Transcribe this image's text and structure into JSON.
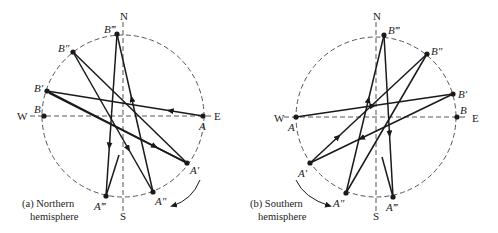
{
  "colors": {
    "ink": "#1a1a1a",
    "dash": "#444444",
    "background": "#ffffff"
  },
  "panels": [
    {
      "id": "northern",
      "caption_line1": "(a)  Northern",
      "caption_line2": "hemisphere",
      "caption_pos": [
        22,
        207
      ],
      "center": [
        123,
        116
      ],
      "radius": 81,
      "cardinals": {
        "N": "N",
        "S": "S",
        "E": "E",
        "W": "W"
      },
      "cardinal_pos": {
        "N": [
          120,
          20
        ],
        "S": [
          120,
          220
        ],
        "E": [
          214,
          120
        ],
        "W": [
          17,
          120
        ]
      },
      "axis_v": [
        [
          123,
          22
        ],
        [
          123,
          212
        ]
      ],
      "axis_h": [
        [
          30,
          116
        ],
        [
          212,
          116
        ]
      ],
      "points": [
        {
          "name": "A",
          "label": "A",
          "xy": [
            203,
            116
          ],
          "lbl_xy": [
            199,
            130
          ]
        },
        {
          "name": "A1",
          "label": "A′",
          "xy": [
            187,
            163
          ],
          "lbl_xy": [
            190,
            174
          ]
        },
        {
          "name": "A2",
          "label": "A″",
          "xy": [
            153,
            192
          ],
          "lbl_xy": [
            155,
            205
          ]
        },
        {
          "name": "A3",
          "label": "A‴",
          "xy": [
            106,
            196
          ],
          "lbl_xy": [
            94,
            210
          ]
        },
        {
          "name": "B",
          "label": "B",
          "xy": [
            44,
            116
          ],
          "lbl_xy": [
            34,
            113
          ]
        },
        {
          "name": "B1",
          "label": "B′",
          "xy": [
            47,
            91
          ],
          "lbl_xy": [
            34,
            92
          ]
        },
        {
          "name": "B2",
          "label": "B″",
          "xy": [
            73,
            52
          ],
          "lbl_xy": [
            58,
            52
          ]
        },
        {
          "name": "B3",
          "label": "B‴",
          "xy": [
            117,
            34
          ],
          "lbl_xy": [
            104,
            33
          ]
        }
      ],
      "segments": [
        {
          "from": [
            203,
            116
          ],
          "to": [
            47,
            91
          ],
          "arrow_at": 0.22
        },
        {
          "from": [
            47,
            91
          ],
          "to": [
            187,
            163
          ],
          "arrow_at": 0.78
        },
        {
          "from": [
            49,
            93
          ],
          "to": [
            187,
            163
          ],
          "arrow_at": null
        },
        {
          "from": [
            187,
            163
          ],
          "to": [
            73,
            52
          ],
          "arrow_at": null
        },
        {
          "from": [
            73,
            52
          ],
          "to": [
            153,
            192
          ],
          "arrow_at": 0.7
        },
        {
          "from": [
            153,
            192
          ],
          "to": [
            117,
            34
          ],
          "arrow_at": 0.6
        },
        {
          "from": [
            117,
            34
          ],
          "to": [
            106,
            196
          ],
          "arrow_at": 0.7
        },
        {
          "from": [
            106,
            196
          ],
          "to": [
            119,
            155
          ],
          "arrow_at": null
        }
      ],
      "motion_arrow": {
        "path": "M200,180 Q192,200 172,206",
        "tip": [
          172,
          206
        ]
      }
    },
    {
      "id": "southern",
      "caption_line1": "(b)  Southern",
      "caption_line2": "hemisphere",
      "caption_pos": [
        250,
        207
      ],
      "center": [
        376,
        117
      ],
      "radius": 80,
      "cardinals": {
        "N": "N",
        "S": "S",
        "E": "E",
        "W": "W"
      },
      "cardinal_pos": {
        "N": [
          373,
          20
        ],
        "S": [
          373,
          220
        ],
        "E": [
          472,
          122
        ],
        "W": [
          274,
          122
        ]
      },
      "axis_v": [
        [
          376,
          22
        ],
        [
          376,
          212
        ]
      ],
      "axis_h": [
        [
          284,
          117
        ],
        [
          468,
          117
        ]
      ],
      "points": [
        {
          "name": "A",
          "label": "A",
          "xy": [
            296,
            117
          ],
          "lbl_xy": [
            288,
            131
          ]
        },
        {
          "name": "A1",
          "label": "A′",
          "xy": [
            310,
            163
          ],
          "lbl_xy": [
            298,
            177
          ]
        },
        {
          "name": "A2",
          "label": "A″",
          "xy": [
            346,
            193
          ],
          "lbl_xy": [
            333,
            207
          ]
        },
        {
          "name": "A3",
          "label": "A‴",
          "xy": [
            393,
            197
          ],
          "lbl_xy": [
            386,
            211
          ]
        },
        {
          "name": "B",
          "label": "B",
          "xy": [
            457,
            117
          ],
          "lbl_xy": [
            460,
            114
          ]
        },
        {
          "name": "B1",
          "label": "B′",
          "xy": [
            453,
            94
          ],
          "lbl_xy": [
            458,
            98
          ]
        },
        {
          "name": "B2",
          "label": "B″",
          "xy": [
            427,
            54
          ],
          "lbl_xy": [
            431,
            55
          ]
        },
        {
          "name": "B3",
          "label": "B‴",
          "xy": [
            384,
            35
          ],
          "lbl_xy": [
            388,
            34
          ]
        }
      ],
      "segments": [
        {
          "from": [
            296,
            117
          ],
          "to": [
            453,
            94
          ],
          "arrow_at": 0.5
        },
        {
          "from": [
            453,
            94
          ],
          "to": [
            310,
            163
          ],
          "arrow_at": 0.65
        },
        {
          "from": [
            310,
            163
          ],
          "to": [
            427,
            54
          ],
          "arrow_at": 0.25
        },
        {
          "from": [
            427,
            54
          ],
          "to": [
            346,
            193
          ],
          "arrow_at": null
        },
        {
          "from": [
            346,
            193
          ],
          "to": [
            384,
            35
          ],
          "arrow_at": 0.6
        },
        {
          "from": [
            384,
            35
          ],
          "to": [
            393,
            197
          ],
          "arrow_at": 0.62
        },
        {
          "from": [
            393,
            197
          ],
          "to": [
            382,
            157
          ],
          "arrow_at": null
        }
      ],
      "motion_arrow": {
        "path": "M296,180 Q304,198 330,206",
        "tip": [
          330,
          206
        ]
      }
    }
  ]
}
